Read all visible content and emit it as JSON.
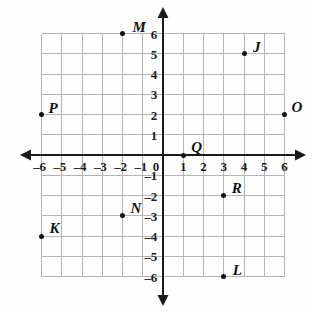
{
  "chart_data": {
    "type": "scatter",
    "title": "",
    "xlabel": "",
    "ylabel": "",
    "xlim": [
      -6,
      6
    ],
    "ylim": [
      -6,
      6
    ],
    "grid": true,
    "legend": "none",
    "x_tick_labels": [
      "–6",
      "–5",
      "–4",
      "–3",
      "–2",
      "–1",
      "0",
      "1",
      "2",
      "3",
      "4",
      "5",
      "6"
    ],
    "x_ticks": [
      -6,
      -5,
      -4,
      -3,
      -2,
      -1,
      0,
      1,
      2,
      3,
      4,
      5,
      6
    ],
    "y_tick_labels": [
      "6",
      "5",
      "4",
      "3",
      "2",
      "1",
      "–1",
      "–2",
      "–3",
      "–4",
      "–5",
      "–6"
    ],
    "y_ticks": [
      6,
      5,
      4,
      3,
      2,
      1,
      -1,
      -2,
      -3,
      -4,
      -5,
      -6
    ],
    "origin_label": "0",
    "points": [
      {
        "label": "M",
        "x": -2,
        "y": 6,
        "label_dx": 10,
        "label_dy": -14
      },
      {
        "label": "J",
        "x": 4,
        "y": 5,
        "label_dx": 9,
        "label_dy": -14
      },
      {
        "label": "P",
        "x": -6,
        "y": 2,
        "label_dx": 7,
        "label_dy": -14
      },
      {
        "label": "O",
        "x": 6,
        "y": 2,
        "label_dx": 7,
        "label_dy": -15
      },
      {
        "label": "Q",
        "x": 1,
        "y": 0,
        "label_dx": 8,
        "label_dy": -15
      },
      {
        "label": "R",
        "x": 3,
        "y": -2,
        "label_dx": 8,
        "label_dy": -15
      },
      {
        "label": "N",
        "x": -2,
        "y": -3,
        "label_dx": 8,
        "label_dy": -15
      },
      {
        "label": "K",
        "x": -6,
        "y": -4,
        "label_dx": 8,
        "label_dy": -15
      },
      {
        "label": "L",
        "x": 3,
        "y": -6,
        "label_dx": 9,
        "label_dy": -14
      }
    ],
    "colors": {
      "grid": "#b4b4b4",
      "axis": "#1a1a1a",
      "point": "#111111",
      "background": "#fefefe"
    }
  }
}
